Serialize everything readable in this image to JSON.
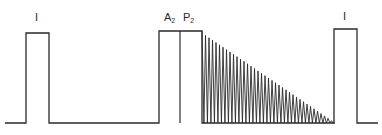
{
  "diagram": {
    "stroke_color": "#2a2a2a",
    "baseline_y": 123,
    "labels": {
      "first_pulse": "I",
      "a2": "A",
      "a2_sub": "2",
      "p2": "P",
      "p2_sub": "2",
      "last_pulse": "I"
    },
    "first_pulse": {
      "x1": 26,
      "x2": 49,
      "top": 33
    },
    "a2p2_box": {
      "x1": 159,
      "x2": 202,
      "mid": 180,
      "top": 31
    },
    "sawtooth": {
      "x_start": 202,
      "x_end": 335,
      "top_start": 33,
      "teeth": 38
    },
    "last_pulse": {
      "x1": 334,
      "x2": 357,
      "top": 29
    },
    "baseline": {
      "x_start": 5,
      "x_end": 378
    }
  }
}
